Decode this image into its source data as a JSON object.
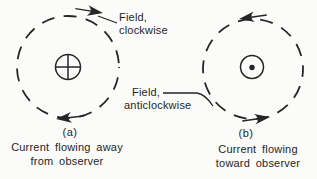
{
  "figure": {
    "background": "#fbfbfa",
    "ink": "#262626",
    "left_diagram": {
      "symbol": "current-away-cross",
      "field_direction": "clockwise",
      "field_label_line1": "Field,",
      "field_label_line2": "clockwise",
      "sublabel": "(a)",
      "caption_line1": "Current flowing away",
      "caption_line2": "from observer"
    },
    "right_diagram": {
      "symbol": "current-toward-dot",
      "field_direction": "anticlockwise",
      "field_label_line1": "Field,",
      "field_label_line2": "anticlockwise",
      "sublabel": "(b)",
      "caption_line1": "Current flowing",
      "caption_line2": "toward observer"
    }
  }
}
